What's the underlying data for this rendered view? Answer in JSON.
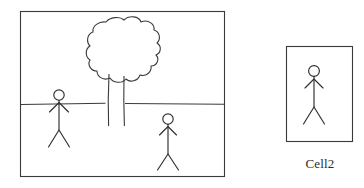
{
  "canvas": {
    "width": 364,
    "height": 188,
    "background_color": "#ffffff",
    "ink_color": "#333333"
  },
  "panels": [
    {
      "name": "scene-panel",
      "x": 20,
      "y": 11,
      "width": 205,
      "height": 166,
      "caption": "",
      "contents": [
        "tree",
        "horizon-line",
        "stick-figure-left",
        "stick-figure-right"
      ]
    },
    {
      "name": "cell2-panel",
      "x": 286,
      "y": 46,
      "width": 67,
      "height": 96,
      "caption": "Cell2",
      "contents": [
        "stick-figure-cell2"
      ]
    }
  ],
  "horizon": {
    "y": 104,
    "left_segment": [
      20,
      105
    ],
    "right_segment": [
      125,
      225
    ],
    "label": "horizon line"
  },
  "tree": {
    "canopy_center_x": 123,
    "canopy_top_y": 18,
    "canopy_bottom_y": 82,
    "canopy_left_x": 88,
    "canopy_right_x": 158,
    "trunk_left_x": 108,
    "trunk_right_x": 124,
    "trunk_bottom_y": 126,
    "style": "cloud-lobed canopy, narrow trunk"
  },
  "figures": [
    {
      "name": "stick-figure-left",
      "head_cx": 59,
      "head_cy": 95,
      "head_r": 5.2,
      "body_top_y": 100,
      "body_bottom_y": 130,
      "arm_span": 13,
      "leg_span": 13,
      "leg_bottom_y": 147
    },
    {
      "name": "stick-figure-right",
      "head_cx": 168,
      "head_cy": 119,
      "head_r": 5.2,
      "body_top_y": 124,
      "body_bottom_y": 154,
      "arm_span": 11,
      "leg_span": 12,
      "leg_bottom_y": 170
    },
    {
      "name": "stick-figure-cell2",
      "head_cx": 314,
      "head_cy": 71,
      "head_r": 5.4,
      "body_top_y": 76,
      "body_bottom_y": 107,
      "arm_span": 12,
      "leg_span": 13,
      "leg_bottom_y": 124
    }
  ],
  "labels": {
    "cell2": "Cell2"
  }
}
